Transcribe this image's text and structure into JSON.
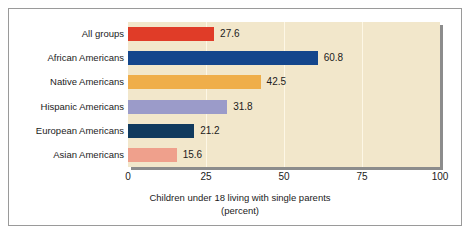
{
  "chart_data": {
    "type": "bar",
    "orientation": "horizontal",
    "title": "",
    "xlabel": "Children under 18 living with single parents",
    "xlabel_sub": "(percent)",
    "ylabel": "",
    "categories": [
      "All groups",
      "African Americans",
      "Native Americans",
      "Hispanic Americans",
      "European Americans",
      "Asian Americans"
    ],
    "values": [
      27.6,
      60.8,
      42.5,
      31.8,
      21.2,
      15.6
    ],
    "value_labels": [
      "27.6",
      "60.8",
      "42.5",
      "31.8",
      "21.2",
      "15.6"
    ],
    "bar_colors": [
      "#e03c28",
      "#14468c",
      "#efae4a",
      "#9b9bc9",
      "#113a5e",
      "#efa08c"
    ],
    "xlim": [
      0,
      100
    ],
    "xticks": [
      0,
      25,
      50,
      75,
      100
    ],
    "xtick_labels": [
      "0",
      "25",
      "50",
      "75",
      "100"
    ],
    "grid": true,
    "grid_axis": "x",
    "legend": false,
    "plot_background": "#f2e7cb",
    "page_background": "#ffffff",
    "border_color": "#9a9a9a",
    "shadow_color": "#8c8c8c"
  }
}
